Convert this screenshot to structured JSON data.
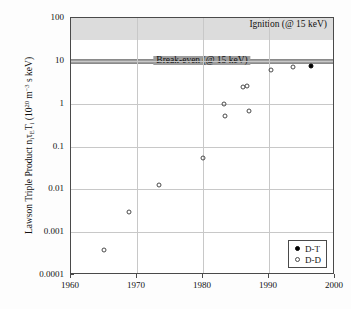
{
  "chart_data": {
    "type": "scatter",
    "title": "",
    "xlabel": "",
    "ylabel": "Lawson Triple Product niτET i (1020 m-3 s keV)",
    "ylabel_parts": {
      "lead": "Lawson Triple Product n",
      "sub1": "i",
      "tau": "τ",
      "sub2": "E",
      "t": "T",
      "sub3": "i",
      "open": " (10",
      "sup1": "20",
      "mid": " m",
      "sup2": "-3",
      "tail": " s keV)"
    },
    "xlim": [
      1960,
      2000
    ],
    "ylim": [
      0.0001,
      100
    ],
    "yscale": "log",
    "xscale": "linear",
    "grid": true,
    "legend_position": "lower right",
    "xticks": [
      1960,
      1970,
      1980,
      1990,
      2000
    ],
    "xtick_labels": [
      "1960",
      "1970",
      "1980",
      "1990",
      "2000"
    ],
    "yticks": [
      100,
      10,
      1,
      0.1,
      0.01,
      0.001,
      0.0001
    ],
    "ytick_labels": [
      "100",
      "10",
      "1",
      "0.1",
      "0.01",
      "0.001",
      "0.0001"
    ],
    "bands": [
      {
        "name": "ignition",
        "label": "Ignition (@ 15 keV)",
        "y_from": 30,
        "y_to": 100,
        "color": "#dcdcdc",
        "label_align": "right"
      },
      {
        "name": "break-even",
        "label": "Break-even (@ 15 keV)",
        "y_from": 9.2,
        "y_to": 11.0,
        "color": "#9d9d9d",
        "label_align": "center"
      }
    ],
    "series": [
      {
        "name": "D-T",
        "marker": "filled-circle",
        "color": "#000000",
        "points": [
          {
            "x": 1996.4,
            "y": 7.5
          }
        ]
      },
      {
        "name": "D-D",
        "marker": "open-circle",
        "color": "#4a4a4a",
        "points": [
          {
            "x": 1965.0,
            "y": 0.00038
          },
          {
            "x": 1968.8,
            "y": 0.003
          },
          {
            "x": 1973.4,
            "y": 0.0125
          },
          {
            "x": 1980.0,
            "y": 0.053
          },
          {
            "x": 1983.2,
            "y": 1.0
          },
          {
            "x": 1983.4,
            "y": 0.52
          },
          {
            "x": 1986.1,
            "y": 2.5
          },
          {
            "x": 1986.6,
            "y": 2.6
          },
          {
            "x": 1987.0,
            "y": 0.69
          },
          {
            "x": 1990.3,
            "y": 6.0
          },
          {
            "x": 1993.7,
            "y": 7.0
          }
        ]
      }
    ]
  },
  "legend": {
    "entries": [
      {
        "label": "D-T",
        "marker": "filled-circle"
      },
      {
        "label": "D-D",
        "marker": "open-circle"
      }
    ]
  }
}
